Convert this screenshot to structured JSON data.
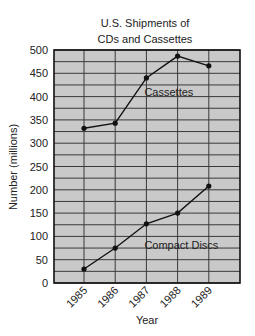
{
  "chart_data": {
    "type": "line",
    "title": "U.S. Shipments of CDs and Cassettes",
    "title_lines": [
      "U.S. Shipments of",
      "CDs and Cassettes"
    ],
    "xlabel": "Year",
    "ylabel": "Number (millions)",
    "categories": [
      "1985",
      "1986",
      "1987",
      "1988",
      "1989"
    ],
    "yticks": [
      0,
      50,
      100,
      150,
      200,
      250,
      300,
      350,
      400,
      450,
      500
    ],
    "ylim": [
      0,
      500
    ],
    "grid": true,
    "minor_grid_step": 25,
    "legend": "inline labels",
    "series": [
      {
        "name": "Cassettes",
        "values": [
          332,
          343,
          440,
          487,
          466
        ]
      },
      {
        "name": "Compact Discs",
        "values": [
          30,
          75,
          127,
          150,
          208
        ]
      }
    ],
    "annotations": [
      {
        "text": "Cassettes",
        "x_category": "1987",
        "y": 410
      },
      {
        "text": "Compact Discs",
        "x_category": "1987",
        "y": 82
      }
    ]
  },
  "colors": {
    "plot_background": "#c9c9c9",
    "grid": "#3a3a3a",
    "line": "#111111",
    "text": "#222222"
  }
}
